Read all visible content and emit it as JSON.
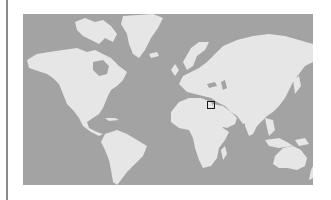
{
  "map": {
    "type": "world-map",
    "projection": "mercator",
    "colors": {
      "ocean": "#a3a3a3",
      "land": "#e6e6e6",
      "marker": "#1a1a1a",
      "rule": "#8a8a8a"
    },
    "marker": {
      "shape": "square",
      "region": "Arabian Peninsula / Persian Gulf"
    }
  }
}
